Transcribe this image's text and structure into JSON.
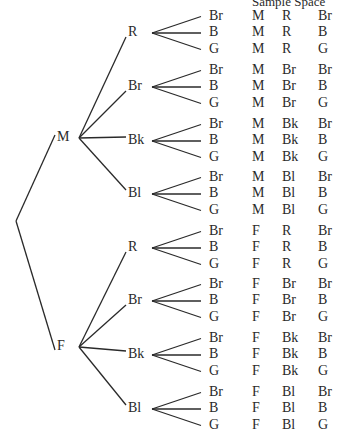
{
  "title": "Sample Space",
  "root": "",
  "level1": [
    {
      "label": "M",
      "y": 138
    },
    {
      "label": "F",
      "y": 347
    }
  ],
  "level2_labels": [
    "R",
    "Br",
    "Bk",
    "Bl"
  ],
  "level3_labels": [
    "Br",
    "B",
    "G"
  ],
  "groups": [
    {
      "parent": "M",
      "label": "R",
      "cy": 33
    },
    {
      "parent": "M",
      "label": "Br",
      "cy": 87
    },
    {
      "parent": "M",
      "label": "Bk",
      "cy": 141
    },
    {
      "parent": "M",
      "label": "Bl",
      "cy": 194
    },
    {
      "parent": "F",
      "label": "R",
      "cy": 248
    },
    {
      "parent": "F",
      "label": "Br",
      "cy": 301
    },
    {
      "parent": "F",
      "label": "Bk",
      "cy": 355
    },
    {
      "parent": "F",
      "label": "Bl",
      "cy": 409
    }
  ],
  "sample_space": [
    [
      "M",
      "R",
      "Br"
    ],
    [
      "M",
      "R",
      "B"
    ],
    [
      "M",
      "R",
      "G"
    ],
    [
      "M",
      "Br",
      "Br"
    ],
    [
      "M",
      "Br",
      "B"
    ],
    [
      "M",
      "Br",
      "G"
    ],
    [
      "M",
      "Bk",
      "Br"
    ],
    [
      "M",
      "Bk",
      "B"
    ],
    [
      "M",
      "Bk",
      "G"
    ],
    [
      "M",
      "Bl",
      "Br"
    ],
    [
      "M",
      "Bl",
      "B"
    ],
    [
      "M",
      "Bl",
      "G"
    ],
    [
      "F",
      "R",
      "Br"
    ],
    [
      "F",
      "R",
      "B"
    ],
    [
      "F",
      "R",
      "G"
    ],
    [
      "F",
      "Br",
      "Br"
    ],
    [
      "F",
      "Br",
      "B"
    ],
    [
      "F",
      "Br",
      "G"
    ],
    [
      "F",
      "Bk",
      "Br"
    ],
    [
      "F",
      "Bk",
      "B"
    ],
    [
      "F",
      "Bk",
      "G"
    ],
    [
      "F",
      "Bl",
      "Br"
    ],
    [
      "F",
      "Bl",
      "B"
    ],
    [
      "F",
      "Bl",
      "G"
    ]
  ],
  "colors": {
    "ink": "#2a2a2a",
    "background": "#ffffff"
  }
}
